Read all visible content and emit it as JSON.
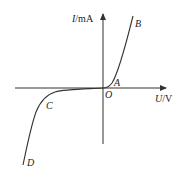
{
  "diagram": {
    "axes": {
      "y_label_var": "I",
      "y_label_unit": "/mA",
      "x_label_var": "U",
      "x_label_unit": "/V",
      "origin_label": "O"
    },
    "points": {
      "A": "A",
      "B": "B",
      "C": "C",
      "D": "D"
    },
    "colors": {
      "stroke": "#333333",
      "text": "#222222"
    }
  }
}
